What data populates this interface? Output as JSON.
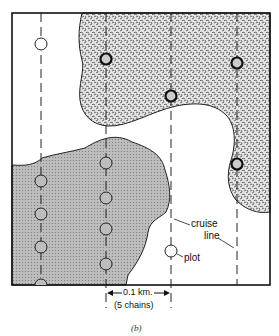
{
  "diagram": {
    "caption": "(b)",
    "labels": {
      "cruise_line": [
        "cruise",
        "line"
      ],
      "plot": "plot",
      "scale_distance": "0.1 km.",
      "scale_chains": "(5 chains)"
    },
    "legend_semantics": {
      "speckled_region": "stand type A (top right)",
      "crosshatch_region": "stand type B (bottom left)",
      "white_region": "open area"
    },
    "cruise_lines_x": [
      41,
      106,
      171,
      237
    ],
    "plots": [
      {
        "x": 41,
        "y": 44,
        "style": "open"
      },
      {
        "x": 106,
        "y": 59,
        "style": "bold"
      },
      {
        "x": 237,
        "y": 63,
        "style": "bold"
      },
      {
        "x": 171,
        "y": 96,
        "style": "bold"
      },
      {
        "x": 237,
        "y": 164,
        "style": "bold"
      },
      {
        "x": 106,
        "y": 163,
        "style": "gray"
      },
      {
        "x": 41,
        "y": 181,
        "style": "gray"
      },
      {
        "x": 106,
        "y": 198,
        "style": "gray"
      },
      {
        "x": 41,
        "y": 214,
        "style": "gray"
      },
      {
        "x": 106,
        "y": 229,
        "style": "gray"
      },
      {
        "x": 41,
        "y": 247,
        "style": "gray"
      },
      {
        "x": 106,
        "y": 264,
        "style": "gray"
      },
      {
        "x": 41,
        "y": 279,
        "style": "gray"
      },
      {
        "x": 171,
        "y": 251,
        "style": "open"
      }
    ]
  }
}
